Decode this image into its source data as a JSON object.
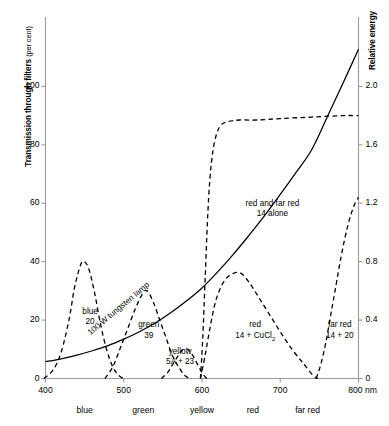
{
  "chart_data": {
    "type": "line",
    "title": "",
    "xlabel": "",
    "ylabel": "Transmission through filters (per cent)",
    "y2label": "Relative energy",
    "xlim": [
      400,
      800
    ],
    "ylim": [
      0,
      120
    ],
    "y2lim": [
      0,
      2.4
    ],
    "grid": false,
    "legend_position": "inline-annotations",
    "xunit": "nm",
    "x_ticks": [
      400,
      500,
      600,
      700,
      800
    ],
    "x_tick_labels": [
      "400",
      "500",
      "600",
      "700",
      "800 nm"
    ],
    "y_ticks": [
      0,
      20,
      40,
      60,
      80,
      100
    ],
    "y_tick_labels": [
      "0",
      "20",
      "40",
      "60",
      "80",
      "100"
    ],
    "y2_ticks": [
      0,
      0.4,
      0.8,
      1.2,
      1.6,
      2.0
    ],
    "y2_tick_labels": [
      "0",
      "0.4",
      "0.8",
      "1.2",
      "1.6",
      "2.0"
    ],
    "spectral_bands": [
      {
        "name": "blue",
        "center": 450
      },
      {
        "name": "green",
        "center": 525
      },
      {
        "name": "yellow",
        "center": 600
      },
      {
        "name": "red",
        "center": 665
      },
      {
        "name": "far red",
        "center": 735
      }
    ],
    "series": [
      {
        "name": "100 W tungsten lamp",
        "style": "solid",
        "axis": "right",
        "label_rotated": true,
        "points": [
          [
            400,
            0.115
          ],
          [
            420,
            0.135
          ],
          [
            440,
            0.16
          ],
          [
            460,
            0.19
          ],
          [
            480,
            0.225
          ],
          [
            500,
            0.27
          ],
          [
            520,
            0.32
          ],
          [
            540,
            0.38
          ],
          [
            560,
            0.45
          ],
          [
            580,
            0.53
          ],
          [
            600,
            0.62
          ],
          [
            620,
            0.73
          ],
          [
            640,
            0.85
          ],
          [
            660,
            0.98
          ],
          [
            680,
            1.115
          ],
          [
            700,
            1.26
          ],
          [
            720,
            1.41
          ],
          [
            740,
            1.565
          ],
          [
            760,
            1.79
          ],
          [
            780,
            2.02
          ],
          [
            800,
            2.255
          ]
        ]
      },
      {
        "name": "blue 20",
        "style": "dashed",
        "axis": "left",
        "label_line1": "blue",
        "label_line2": "20",
        "points": [
          [
            398,
            0
          ],
          [
            410,
            3
          ],
          [
            420,
            9
          ],
          [
            430,
            20
          ],
          [
            437,
            31
          ],
          [
            445,
            39
          ],
          [
            450,
            40
          ],
          [
            456,
            37
          ],
          [
            463,
            29
          ],
          [
            470,
            19
          ],
          [
            478,
            10
          ],
          [
            486,
            4
          ],
          [
            494,
            1
          ],
          [
            500,
            0
          ]
        ]
      },
      {
        "name": "green 39",
        "style": "dashed",
        "axis": "left",
        "label_line1": "green",
        "label_line2": "39",
        "points": [
          [
            476,
            0
          ],
          [
            486,
            4
          ],
          [
            495,
            10
          ],
          [
            505,
            17
          ],
          [
            515,
            24
          ],
          [
            524,
            29
          ],
          [
            530,
            30
          ],
          [
            538,
            26
          ],
          [
            546,
            20
          ],
          [
            554,
            14
          ],
          [
            562,
            8
          ],
          [
            570,
            4
          ],
          [
            578,
            1
          ],
          [
            585,
            0
          ]
        ]
      },
      {
        "name": "yellow 5A + 23",
        "style": "dashed",
        "axis": "left",
        "label_line1": "yellow",
        "label_line2": "5A + 23",
        "points": [
          [
            548,
            0
          ],
          [
            556,
            2
          ],
          [
            563,
            5
          ],
          [
            570,
            8
          ],
          [
            576,
            10
          ],
          [
            582,
            10
          ],
          [
            588,
            8
          ],
          [
            594,
            5
          ],
          [
            600,
            2
          ],
          [
            606,
            0
          ]
        ]
      },
      {
        "name": "red 14 + CuCl2",
        "style": "dashed",
        "axis": "left",
        "label_line1": "red",
        "label_line2_pre": "14 + CuCl",
        "label_line2_sub": "2",
        "points": [
          [
            598,
            0
          ],
          [
            604,
            8
          ],
          [
            610,
            17
          ],
          [
            616,
            25
          ],
          [
            622,
            30
          ],
          [
            630,
            34
          ],
          [
            640,
            36
          ],
          [
            650,
            36
          ],
          [
            660,
            33
          ],
          [
            672,
            28
          ],
          [
            686,
            22
          ],
          [
            700,
            16
          ],
          [
            715,
            10
          ],
          [
            730,
            5
          ],
          [
            742,
            1
          ],
          [
            748,
            0
          ]
        ]
      },
      {
        "name": "far red 14 + 20",
        "style": "dashed",
        "axis": "left",
        "label_line1": "far red",
        "label_line2": "14 + 20",
        "points": [
          [
            746,
            0
          ],
          [
            752,
            5
          ],
          [
            758,
            12
          ],
          [
            764,
            21
          ],
          [
            770,
            30
          ],
          [
            778,
            42
          ],
          [
            786,
            52
          ],
          [
            794,
            59
          ],
          [
            800,
            62
          ]
        ]
      },
      {
        "name": "red and far red 14 alone",
        "style": "dashed",
        "axis": "left",
        "label_line1": "red and far red",
        "label_line2": "14 alone",
        "points": [
          [
            598,
            0
          ],
          [
            601,
            14
          ],
          [
            604,
            34
          ],
          [
            607,
            54
          ],
          [
            610,
            68
          ],
          [
            614,
            78
          ],
          [
            619,
            84
          ],
          [
            625,
            87
          ],
          [
            634,
            88
          ],
          [
            648,
            88.5
          ],
          [
            670,
            88.5
          ],
          [
            700,
            89
          ],
          [
            740,
            89.5
          ],
          [
            780,
            90
          ],
          [
            800,
            90
          ]
        ]
      }
    ]
  },
  "annotations": {
    "lamp": "100 W tungsten lamp",
    "blue_l1": "blue",
    "blue_l2": "20",
    "green_l1": "green",
    "green_l2": "39",
    "yellow_l1": "yellow",
    "yellow_l2": "5A + 23",
    "red_l1": "red",
    "red_l2_pre": "14 + CuCl",
    "red_l2_sub": "2",
    "farred_l1": "far red",
    "farred_l2": "14 + 20",
    "fourteen_l1": "red and far red",
    "fourteen_l2": "14 alone"
  },
  "colors": {
    "ink": "#000000",
    "axis": "#9a9a9a",
    "background": "#ffffff"
  }
}
